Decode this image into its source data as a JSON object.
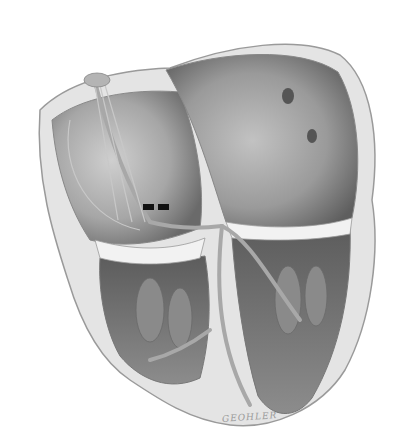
{
  "image": {
    "subject": "Cross-section illustration of the human heart showing the cardiac conduction system",
    "style": "grayscale medical illustration",
    "signature": "GEOHLER",
    "colors": {
      "background": "#ffffff",
      "wall": "#e2e2e2",
      "wall_edge": "#9a9a9a",
      "chamber_dark": "#6e6e6e",
      "chamber_mid": "#9c9c9c",
      "chamber_light": "#c4c4c4",
      "conduction_path": "#a8a8a8",
      "marker": "#111111"
    },
    "regions": [
      {
        "name": "right-atrium",
        "position": "upper-left"
      },
      {
        "name": "left-atrium",
        "position": "upper-right"
      },
      {
        "name": "right-ventricle",
        "position": "lower-left"
      },
      {
        "name": "left-ventricle",
        "position": "lower-right"
      },
      {
        "name": "sa-node",
        "position": "top-left of atrium"
      },
      {
        "name": "av-node-bundle-branches",
        "position": "center septum"
      }
    ],
    "markers": [
      {
        "name": "marker-left",
        "x": 143,
        "y": 204
      },
      {
        "name": "marker-right",
        "x": 158,
        "y": 204
      }
    ]
  }
}
